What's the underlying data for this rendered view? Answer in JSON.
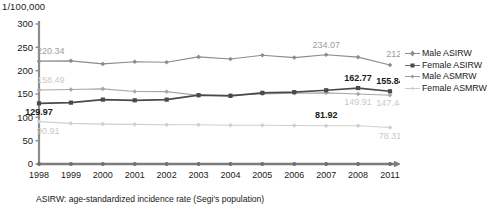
{
  "unit_label": "1/100,000",
  "caption": "ASIRW: age-standardized incidence rate (Segi's population)",
  "colors": {
    "male_asirw": "#8c8c8c",
    "female_asirw": "#a8a8a8",
    "male_asmrw": "#4a4a4a",
    "female_asmrw": "#cfcfcf",
    "axis": "#8c8c8c",
    "text": "#1a1a1a",
    "label_gray": "#9d9d9d",
    "label_light": "#c9c9c9"
  },
  "legend": {
    "items": [
      {
        "label": "Male ASIRW",
        "color": "#8c8c8c",
        "marker": "diamond"
      },
      {
        "label": "Female ASIRW",
        "color": "#a8a8a8",
        "marker": "square"
      },
      {
        "label": "Male ASMRW",
        "color": "#6e6e6e",
        "marker": "line"
      },
      {
        "label": "Female ASMRW",
        "color": "#cfcfcf",
        "marker": "line"
      }
    ]
  },
  "chart_data": {
    "type": "line",
    "title": "",
    "xlabel": "",
    "ylabel": "1/100,000",
    "ylim": [
      0,
      300
    ],
    "yticks": [
      0,
      50,
      100,
      150,
      200,
      250,
      300
    ],
    "grid": false,
    "legend_position": "right",
    "categories": [
      "1998",
      "1999",
      "2000",
      "2001",
      "2002",
      "2003",
      "2004",
      "2005",
      "2006",
      "2007",
      "2008",
      "2011"
    ],
    "series": [
      {
        "name": "Male ASIRW",
        "color": "#8c8c8c",
        "values": [
          220.34,
          221.0,
          214.5,
          219.0,
          218.0,
          229.5,
          225.0,
          233.0,
          228.0,
          234.07,
          229.0,
          212.18
        ],
        "labels": [
          {
            "index": 0,
            "text": "220.34",
            "style": "gray"
          },
          {
            "index": 9,
            "text": "234.07",
            "style": "gray"
          },
          {
            "index": 11,
            "text": "212.18",
            "style": "gray"
          }
        ]
      },
      {
        "name": "Female ASIRW",
        "color": "#a8a8a8",
        "values": [
          158.49,
          159.5,
          161.0,
          155.5,
          155.0,
          147.0,
          147.5,
          150.0,
          151.5,
          152.5,
          149.91,
          147.44
        ],
        "labels": [
          {
            "index": 0,
            "text": "158.49",
            "style": "light"
          },
          {
            "index": 10,
            "text": "149.91",
            "style": "light"
          },
          {
            "index": 11,
            "text": "147.44",
            "style": "light"
          }
        ]
      },
      {
        "name": "Male ASMRW",
        "color": "#4a4a4a",
        "values": [
          129.97,
          131.5,
          138.0,
          136.5,
          138.0,
          147.5,
          146.0,
          152.5,
          154.0,
          158.0,
          162.77,
          155.84
        ],
        "labels": [
          {
            "index": 0,
            "text": "129.97",
            "style": "dark"
          },
          {
            "index": 10,
            "text": "162.77",
            "style": "dark"
          },
          {
            "index": 11,
            "text": "155.84",
            "style": "dark"
          }
        ]
      },
      {
        "name": "Female ASMRW",
        "color": "#cfcfcf",
        "values": [
          90.91,
          87.0,
          85.5,
          85.0,
          84.0,
          84.0,
          83.0,
          83.0,
          82.5,
          81.92,
          82.0,
          78.31
        ],
        "labels": [
          {
            "index": 0,
            "text": "90.91",
            "style": "light"
          },
          {
            "index": 9,
            "text": "81.92",
            "style": "dark"
          },
          {
            "index": 11,
            "text": "78.31",
            "style": "light"
          }
        ]
      }
    ]
  }
}
